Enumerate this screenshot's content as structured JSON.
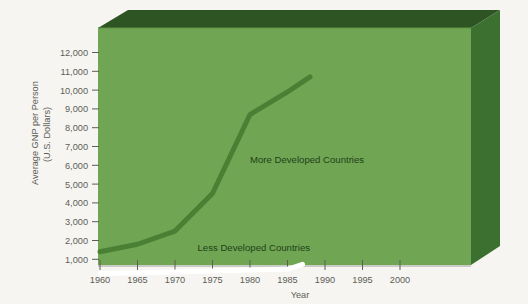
{
  "chart_data": {
    "type": "line",
    "title": "",
    "xlabel": "Year",
    "ylabel": "Average GNP per Person (U.S. Dollars)",
    "ylabel_line1": "Average GNP per Person",
    "ylabel_line2": "(U.S. Dollars)",
    "xlim": [
      1960,
      2003
    ],
    "ylim": [
      0,
      12600
    ],
    "grid": false,
    "legend_position": "inline-annotation",
    "x_ticks": [
      1960,
      1965,
      1970,
      1975,
      1980,
      1985,
      1990,
      1995,
      2000
    ],
    "x_tick_labels": [
      "1960",
      "1965",
      "1970",
      "1975",
      "1980",
      "1985",
      "1990",
      "1995",
      "2000"
    ],
    "y_ticks": [
      1000,
      2000,
      3000,
      4000,
      5000,
      6000,
      7000,
      8000,
      9000,
      10000,
      11000,
      12000
    ],
    "y_tick_labels": [
      "1,000",
      "2,000",
      "3,000",
      "4,000",
      "5,000",
      "6,000",
      "7,000",
      "8,000",
      "9,000",
      "10,000",
      "11,000",
      "12,000"
    ],
    "series": [
      {
        "name": "More Developed Countries",
        "color": "#4a8033",
        "label_x": 1980,
        "label_y": 6100,
        "x": [
          1960,
          1965,
          1970,
          1975,
          1980,
          1985,
          1988
        ],
        "values": [
          1400,
          1800,
          2500,
          4500,
          8700,
          9900,
          10700
        ]
      },
      {
        "name": "Less Developed Countries",
        "color": "#ffffff",
        "label_x": 1973,
        "label_y": 1450,
        "x": [
          1960,
          1965,
          1970,
          1975,
          1980,
          1985,
          1987
        ],
        "values": [
          250,
          280,
          320,
          380,
          430,
          470,
          730
        ]
      }
    ],
    "colors": {
      "panel_face": "#6fa553",
      "panel_top": "#2f5423",
      "panel_side": "#3c7030",
      "background": "#f6f5f1",
      "tick_text": "#5d5d58",
      "more_developed_line": "#4a8033",
      "less_developed_line": "#ffffff"
    }
  }
}
